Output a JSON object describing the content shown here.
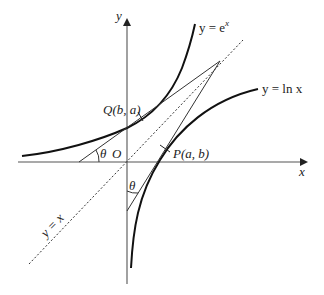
{
  "diagram": {
    "type": "function-graph",
    "axes": {
      "x_label": "x",
      "y_label": "y",
      "origin_label": "O"
    },
    "curves": [
      {
        "name": "exponential",
        "label": "y = e",
        "label_sup": "x",
        "style": "solid-thick"
      },
      {
        "name": "logarithm",
        "label": "y = ln x",
        "style": "solid-thick"
      },
      {
        "name": "identity",
        "label": "y = x",
        "style": "dotted"
      }
    ],
    "points": [
      {
        "name": "Q",
        "label": "Q(b, a)",
        "on": "exponential"
      },
      {
        "name": "P",
        "label": "P(a, b)",
        "on": "logarithm"
      }
    ],
    "angles": [
      {
        "label": "θ",
        "between": "tangent at Q and x-axis"
      },
      {
        "label": "θ",
        "between": "tangent at P and y-axis"
      }
    ],
    "colors": {
      "stroke": "#222222",
      "axis": "#555555",
      "background": "#ffffff"
    }
  }
}
